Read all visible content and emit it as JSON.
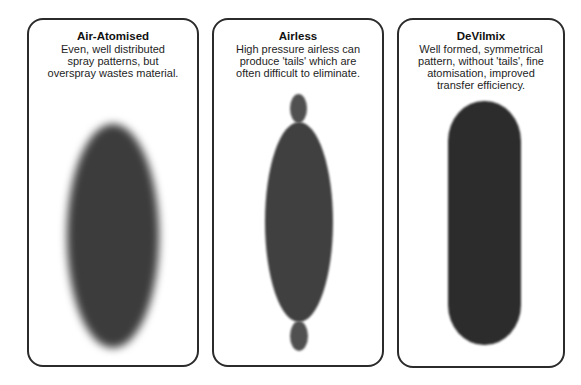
{
  "panels": [
    {
      "title": "Air-Atomised",
      "description": "Even, well distributed spray patterns, but overspray wastes material.",
      "shape": "ellipse-soft-edge"
    },
    {
      "title": "Airless",
      "description": "High pressure airless can produce 'tails' which are often difficult to eliminate.",
      "shape": "ellipse-with-tails"
    },
    {
      "title": "DeVilmix",
      "description": "Well formed, symmetrical pattern, without 'tails', fine atomisation, improved transfer efficiency.",
      "shape": "capsule"
    }
  ],
  "colors": {
    "border": "#2b2b2b",
    "spray": "#3a3a3a",
    "background": "#ffffff"
  }
}
